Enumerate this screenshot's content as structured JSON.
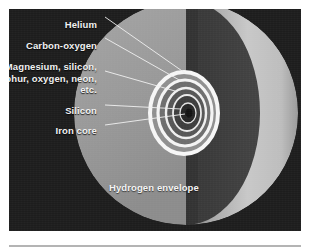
{
  "figure": {
    "panel_background_color": "#1d1d1d"
  },
  "labels": {
    "helium": "Helium",
    "carbon_oxygen": "Carbon-oxygen",
    "heavy_elements": "Magnesium, silicon, sulphur, oxygen, neon, etc.",
    "silicon": "Silicon",
    "iron_core": "Iron core",
    "hydrogen_envelope": "Hydrogen envelope"
  },
  "colors": {
    "background": "#1d1d1d",
    "cut_face": "#9a9a9a",
    "shadow_band": "#3a3a3a",
    "bright_limb": "#c8c8c8",
    "shell_ring": "#f6f6f6",
    "label_text": "#f2f2f2",
    "caption_rule": "#b4b4b4"
  },
  "geometry": {
    "sphere_center_x": 186,
    "sphere_center_y": 113,
    "sphere_radius": 112,
    "core_center_x": 184,
    "core_center_y": 113
  },
  "shells": [
    {
      "name": "hydrogen-envelope",
      "rx": 112,
      "ry": 112,
      "fill": "#9a9a9a",
      "ring": false
    },
    {
      "name": "helium-shell",
      "rx": 34,
      "ry": 41,
      "fill": "#8f8f8f",
      "ring": true
    },
    {
      "name": "carbon-oxygen-shell",
      "rx": 27,
      "ry": 33,
      "fill": "#6e6e6e",
      "ring": true
    },
    {
      "name": "heavy-element-shell",
      "rx": 20,
      "ry": 25,
      "fill": "#5a5a5a",
      "ring": true
    },
    {
      "name": "silicon-shell",
      "rx": 14,
      "ry": 18,
      "fill": "#3f3f3f",
      "ring": true
    },
    {
      "name": "iron-core",
      "rx": 8,
      "ry": 10,
      "fill": "#2a2a2a",
      "ring": true
    }
  ]
}
